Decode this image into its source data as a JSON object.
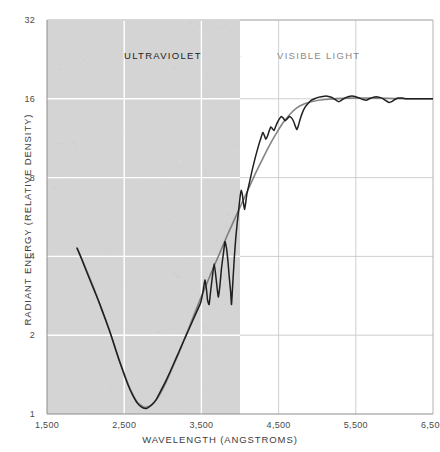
{
  "figure": {
    "background": "#ffffff",
    "plot": {
      "left": 47,
      "top": 20,
      "right": 433,
      "bottom": 414
    }
  },
  "bands": {
    "ultraviolet": {
      "label": "ULTRAVIOLET",
      "color": "#1d1d1d",
      "shade": "#d4d4d4",
      "x_start": 1500,
      "x_end": 4000
    },
    "visible": {
      "label": "VISIBLE LIGHT",
      "color": "#8a8a8a",
      "shade": "#ffffff",
      "x_start": 4000,
      "x_end": 6500
    }
  },
  "chart_data": {
    "type": "line",
    "title": "",
    "xlabel": "WAVELENGTH (ANGSTROMS)",
    "ylabel": "RADIANT ENERGY (RELATIVE DENSITY)",
    "xlim": [
      1500,
      6500
    ],
    "ylim": [
      1,
      32
    ],
    "yscale": "log2",
    "grid": true,
    "legend": "none",
    "xticks": [
      1500,
      2500,
      3500,
      4500,
      5500,
      6500
    ],
    "xticklabels": [
      "1,500",
      "2,500",
      "3,500",
      "4,500",
      "5,500",
      "6,500"
    ],
    "yticks": [
      1,
      2,
      4,
      8,
      16,
      32
    ],
    "yticklabels": [
      "1",
      "2",
      "4",
      "8",
      "16",
      "32"
    ],
    "annotations": [
      {
        "text": "ULTRAVIOLET",
        "x": 2500,
        "y": 24
      },
      {
        "text": "VISIBLE LIGHT",
        "x": 4480,
        "y": 24
      }
    ],
    "series": [
      {
        "name": "smooth-envelope",
        "style": "solid",
        "color": "#6e6e6e",
        "width": 1.6,
        "points": [
          [
            1890,
            4.3
          ],
          [
            1960,
            3.85
          ],
          [
            2040,
            3.38
          ],
          [
            2130,
            2.9
          ],
          [
            2220,
            2.45
          ],
          [
            2310,
            2.08
          ],
          [
            2400,
            1.72
          ],
          [
            2490,
            1.45
          ],
          [
            2580,
            1.24
          ],
          [
            2670,
            1.11
          ],
          [
            2760,
            1.06
          ],
          [
            2850,
            1.08
          ],
          [
            2940,
            1.16
          ],
          [
            3030,
            1.3
          ],
          [
            3120,
            1.49
          ],
          [
            3210,
            1.72
          ],
          [
            3300,
            2.0
          ],
          [
            3390,
            2.33
          ],
          [
            3480,
            2.72
          ],
          [
            3570,
            3.15
          ],
          [
            3660,
            3.65
          ],
          [
            3750,
            4.2
          ],
          [
            3840,
            4.85
          ],
          [
            3930,
            5.55
          ],
          [
            4020,
            6.35
          ],
          [
            4110,
            7.25
          ],
          [
            4200,
            8.3
          ],
          [
            4290,
            9.4
          ],
          [
            4380,
            10.6
          ],
          [
            4470,
            11.8
          ],
          [
            4560,
            13.0
          ],
          [
            4650,
            14.0
          ],
          [
            4740,
            14.8
          ],
          [
            4830,
            15.3
          ],
          [
            4920,
            15.6
          ],
          [
            5100,
            15.9
          ],
          [
            5400,
            16.1
          ],
          [
            5800,
            16.1
          ],
          [
            6200,
            16.0
          ],
          [
            6500,
            16.0
          ]
        ]
      },
      {
        "name": "solar-spectrum",
        "style": "solid",
        "color": "#1f1f1f",
        "width": 1.5,
        "points": [
          [
            1890,
            4.3
          ],
          [
            1950,
            3.9
          ],
          [
            2010,
            3.52
          ],
          [
            2070,
            3.18
          ],
          [
            2130,
            2.88
          ],
          [
            2190,
            2.6
          ],
          [
            2250,
            2.33
          ],
          [
            2310,
            2.08
          ],
          [
            2370,
            1.84
          ],
          [
            2430,
            1.62
          ],
          [
            2490,
            1.44
          ],
          [
            2550,
            1.29
          ],
          [
            2610,
            1.18
          ],
          [
            2670,
            1.1
          ],
          [
            2730,
            1.06
          ],
          [
            2790,
            1.05
          ],
          [
            2850,
            1.08
          ],
          [
            2910,
            1.13
          ],
          [
            2970,
            1.22
          ],
          [
            3030,
            1.32
          ],
          [
            3090,
            1.44
          ],
          [
            3150,
            1.58
          ],
          [
            3210,
            1.73
          ],
          [
            3270,
            1.9
          ],
          [
            3330,
            2.08
          ],
          [
            3390,
            2.28
          ],
          [
            3450,
            2.5
          ],
          [
            3490,
            2.66
          ],
          [
            3520,
            2.92
          ],
          [
            3545,
            3.25
          ],
          [
            3565,
            3.0
          ],
          [
            3580,
            2.72
          ],
          [
            3600,
            2.62
          ],
          [
            3620,
            2.95
          ],
          [
            3645,
            3.4
          ],
          [
            3665,
            3.75
          ],
          [
            3685,
            3.4
          ],
          [
            3705,
            3.0
          ],
          [
            3720,
            2.8
          ],
          [
            3740,
            3.1
          ],
          [
            3760,
            3.6
          ],
          [
            3785,
            4.1
          ],
          [
            3805,
            4.55
          ],
          [
            3825,
            4.3
          ],
          [
            3845,
            3.8
          ],
          [
            3862,
            3.3
          ],
          [
            3878,
            2.95
          ],
          [
            3890,
            2.62
          ],
          [
            3905,
            3.1
          ],
          [
            3925,
            3.9
          ],
          [
            3945,
            4.7
          ],
          [
            3965,
            5.4
          ],
          [
            3985,
            6.1
          ],
          [
            4000,
            6.7
          ],
          [
            4015,
            7.15
          ],
          [
            4030,
            6.9
          ],
          [
            4045,
            6.4
          ],
          [
            4058,
            6.05
          ],
          [
            4072,
            6.35
          ],
          [
            4090,
            6.95
          ],
          [
            4120,
            7.6
          ],
          [
            4160,
            8.6
          ],
          [
            4200,
            9.6
          ],
          [
            4240,
            10.6
          ],
          [
            4270,
            11.3
          ],
          [
            4295,
            11.9
          ],
          [
            4315,
            11.6
          ],
          [
            4335,
            11.2
          ],
          [
            4355,
            11.5
          ],
          [
            4380,
            12.1
          ],
          [
            4400,
            12.5
          ],
          [
            4420,
            12.3
          ],
          [
            4440,
            12.1
          ],
          [
            4460,
            12.5
          ],
          [
            4485,
            13.0
          ],
          [
            4510,
            13.4
          ],
          [
            4535,
            13.7
          ],
          [
            4560,
            13.5
          ],
          [
            4585,
            13.2
          ],
          [
            4610,
            13.4
          ],
          [
            4640,
            13.7
          ],
          [
            4670,
            13.5
          ],
          [
            4695,
            13.1
          ],
          [
            4715,
            12.6
          ],
          [
            4735,
            12.2
          ],
          [
            4755,
            12.6
          ],
          [
            4780,
            13.4
          ],
          [
            4810,
            14.2
          ],
          [
            4845,
            14.9
          ],
          [
            4885,
            15.4
          ],
          [
            4925,
            15.8
          ],
          [
            4965,
            16.0
          ],
          [
            5010,
            16.2
          ],
          [
            5060,
            16.3
          ],
          [
            5110,
            16.4
          ],
          [
            5160,
            16.3
          ],
          [
            5205,
            16.1
          ],
          [
            5245,
            15.8
          ],
          [
            5280,
            15.6
          ],
          [
            5315,
            15.8
          ],
          [
            5355,
            16.1
          ],
          [
            5400,
            16.3
          ],
          [
            5450,
            16.4
          ],
          [
            5500,
            16.3
          ],
          [
            5550,
            16.1
          ],
          [
            5595,
            15.9
          ],
          [
            5635,
            15.8
          ],
          [
            5675,
            16.0
          ],
          [
            5720,
            16.2
          ],
          [
            5765,
            16.3
          ],
          [
            5810,
            16.2
          ],
          [
            5855,
            16.0
          ],
          [
            5895,
            15.7
          ],
          [
            5930,
            15.5
          ],
          [
            5965,
            15.6
          ],
          [
            6005,
            15.9
          ],
          [
            6050,
            16.1
          ],
          [
            6100,
            16.1
          ],
          [
            6160,
            16.0
          ],
          [
            6230,
            16.0
          ],
          [
            6310,
            16.0
          ],
          [
            6400,
            16.0
          ],
          [
            6500,
            16.0
          ]
        ]
      }
    ]
  }
}
